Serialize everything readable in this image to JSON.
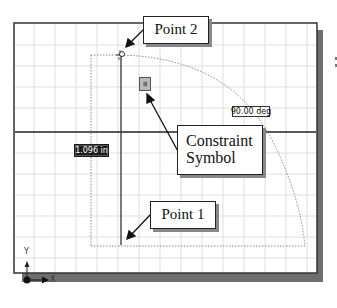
{
  "callouts": {
    "point2": "Point 2",
    "constraint_line1": "Constraint",
    "constraint_line2": "Symbol",
    "point1": "Point 1"
  },
  "dimensions": {
    "length": "1.096 in",
    "angle": "90.00 deg"
  },
  "constraint_icon": {
    "name": "constraint-symbol-icon",
    "glyph": "≡"
  },
  "axes": {
    "x_label": "X",
    "y_label": "Y"
  },
  "colors": {
    "grid": "#dcdcdc",
    "frame": "#333333",
    "shadow": "#6e6e6e",
    "line": "#222222",
    "dotted": "#888888"
  }
}
